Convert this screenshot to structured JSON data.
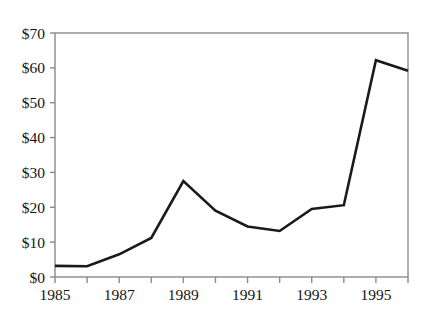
{
  "chart_data": {
    "type": "line",
    "title": "",
    "xlabel": "",
    "ylabel": "",
    "x": [
      1985,
      1986,
      1987,
      1988,
      1989,
      1990,
      1991,
      1992,
      1993,
      1994,
      1995,
      1996
    ],
    "values": [
      3.2,
      3.1,
      6.5,
      11.2,
      27.5,
      19.0,
      14.5,
      13.2,
      19.5,
      20.6,
      62.2,
      59.2
    ],
    "x_tick_labels": [
      "1985",
      "1987",
      "1989",
      "1991",
      "1993",
      "1995"
    ],
    "x_tick_values": [
      1985,
      1987,
      1989,
      1991,
      1993,
      1995
    ],
    "x_minor_tick_values": [
      1986,
      1988,
      1990,
      1992,
      1994,
      1996
    ],
    "xlim": [
      1985,
      1996
    ],
    "y_tick_labels": [
      "$0",
      "$10",
      "$20",
      "$30",
      "$40",
      "$50",
      "$60",
      "$70"
    ],
    "y_tick_values": [
      0,
      10,
      20,
      30,
      40,
      50,
      60,
      70
    ],
    "ylim": [
      0,
      70
    ],
    "grid": false,
    "legend": null,
    "series_color": "#1a1a1a",
    "axis_color": "#8a8a8a",
    "value_prefix": "$"
  },
  "figure": {
    "clipped_header_text": ""
  }
}
